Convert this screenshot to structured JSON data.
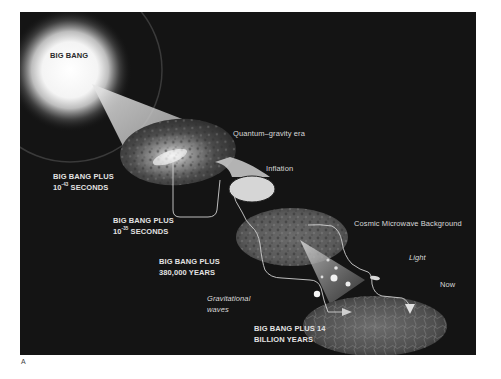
{
  "figure": {
    "letter": "A",
    "background_color": "#141414",
    "label_color": "#d9d9d9"
  },
  "stages": [
    {
      "id": "big-bang",
      "label": "BIG BANG"
    },
    {
      "id": "quantum-gravity",
      "label": "Quantum–gravity era",
      "time_line1": "BIG BANG PLUS",
      "time_line2_base": "10",
      "time_line2_exp": "-43",
      "time_line2_unit": "SECONDS"
    },
    {
      "id": "inflation",
      "label": "Inflation",
      "time_line1": "BIG BANG PLUS",
      "time_line2_base": "10",
      "time_line2_exp": "-35",
      "time_line2_unit": "SECONDS"
    },
    {
      "id": "cmb",
      "label": "Cosmic Microwave Background",
      "time_line1": "BIG BANG PLUS",
      "time_line2": "380,000 YEARS"
    },
    {
      "id": "now",
      "label": "Now",
      "time_line1": "BIG BANG PLUS 14",
      "time_line2": "BILLION YEARS"
    }
  ],
  "signals": {
    "gravitational_waves_line1": "Gravitational",
    "gravitational_waves_line2": "waves",
    "light": "Light"
  }
}
